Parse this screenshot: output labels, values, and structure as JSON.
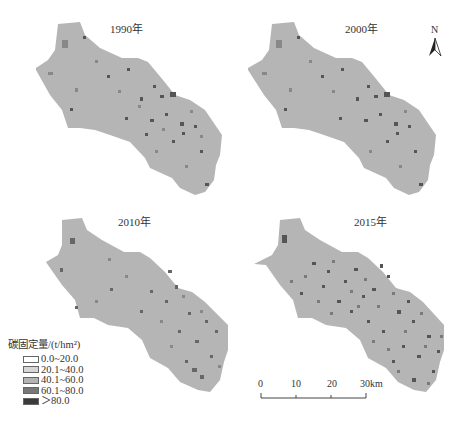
{
  "panels": [
    {
      "title": "1990年",
      "density": "low"
    },
    {
      "title": "2000年",
      "density": "low"
    },
    {
      "title": "2010年",
      "density": "medium"
    },
    {
      "title": "2015年",
      "density": "high"
    }
  ],
  "north_arrow": {
    "label": "N"
  },
  "legend": {
    "title": "碳固定量/(t/hm²)",
    "items": [
      {
        "label": "0.0~20.0",
        "color": "#ffffff"
      },
      {
        "label": "20.1~40.0",
        "color": "#d6d6d6"
      },
      {
        "label": "40.1~60.0",
        "color": "#b4b4b4"
      },
      {
        "label": "60.1~80.0",
        "color": "#787878"
      },
      {
        "label": "＞80.0",
        "color": "#3a3a3a"
      }
    ]
  },
  "scale_bar": {
    "ticks": [
      "0",
      "10",
      "20",
      "30km"
    ]
  },
  "colors": {
    "base_fill": "#b5b5b5",
    "dark_patch": "#555555",
    "mid_patch": "#888888"
  }
}
